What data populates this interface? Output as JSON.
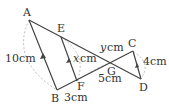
{
  "figure": {
    "type": "geometry",
    "colors": {
      "line": "#444444",
      "dashed": "#999999",
      "text": "#333333"
    },
    "points": {
      "A": {
        "label": "A"
      },
      "B": {
        "label": "B"
      },
      "C": {
        "label": "C"
      },
      "D": {
        "label": "D"
      },
      "E": {
        "label": "E"
      },
      "F": {
        "label": "F"
      },
      "G": {
        "label": "G"
      }
    },
    "lengths": {
      "AB": "10cm",
      "EF_var": "x",
      "EF_unit": "cm",
      "GC_var": "y",
      "GC_unit": "cm",
      "CD": "4cm",
      "BF": "3cm",
      "FG": "5cm"
    }
  }
}
